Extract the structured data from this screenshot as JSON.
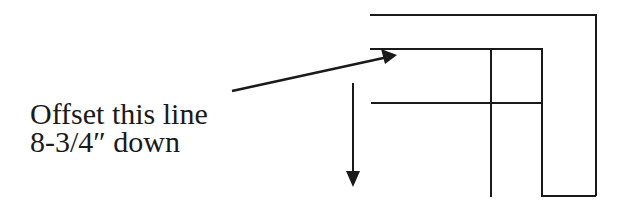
{
  "diagram": {
    "type": "annotated drawing",
    "annotation": {
      "line1": "Offset this line",
      "line2": "8-3/4″ down"
    },
    "stroke_color": "#1a1a1a",
    "background": "#ffffff",
    "elements": {
      "outer_top_line": "horizontal line at top, wrapping right side down",
      "target_line": "horizontal line indicated by arrow (to be offset)",
      "lower_line": "horizontal line below target",
      "inner_vertical": "vertical line crossing both inner horizontals",
      "right_channel": "U-shaped channel on right side",
      "pointer_arrow": "diagonal arrow from text to target line",
      "direction_arrow": "vertical downward arrow indicating offset direction"
    }
  }
}
